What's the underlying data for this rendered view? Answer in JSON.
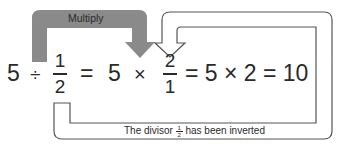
{
  "diagram": {
    "multiply_label": "Multiply",
    "equation": {
      "lhs_whole": "5",
      "div_sign": "÷",
      "lhs_num": "1",
      "lhs_den": "2",
      "eq1": "=",
      "mid_whole": "5",
      "times1": "×",
      "mid_num": "2",
      "mid_den": "1",
      "tail": "= 5 × 2 = 10"
    },
    "inverted_label_pre": "The divisor",
    "inverted_frac_num": "1",
    "inverted_frac_den": "2",
    "inverted_label_post": "has been inverted",
    "colors": {
      "gray_arrow": "#8a8a8a",
      "outline_arrow": "#555555",
      "text": "#2a2a2a"
    }
  }
}
